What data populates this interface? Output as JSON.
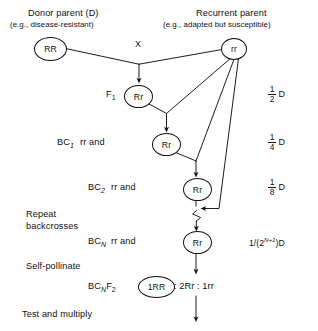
{
  "diagram": {
    "type": "pedigree-flow",
    "headings": {
      "donor_title": "Donor parent (D)",
      "donor_subtitle": "(e.g., disease-resistant)",
      "recurrent_title": "Recurrent parent",
      "recurrent_subtitle": "(e.g., adapted but susceptible)"
    },
    "cross_symbol": "X",
    "nodes": {
      "donor": "RR",
      "recurrent": "rr",
      "f1": "Rr",
      "bc1": "Rr",
      "bc2": "Rr",
      "bcn": "Rr",
      "bcnf2": "1RR"
    },
    "rows": [
      {
        "id": "f1",
        "prefix": "F",
        "sub": "1",
        "mid": "",
        "tail": ""
      },
      {
        "id": "bc1",
        "prefix": "BC",
        "sub": "1",
        "mid": "rr  and",
        "tail": ""
      },
      {
        "id": "bc2",
        "prefix": "BC",
        "sub": "2",
        "mid": "rr  and",
        "tail": ""
      },
      {
        "id": "bcn",
        "prefix": "BC",
        "sub": "N",
        "mid": "rr  and",
        "tail": ""
      },
      {
        "id": "bcnf2",
        "prefix": "BC",
        "sub": "N",
        "mid": "",
        "tail": ": 2Rr : 1rr",
        "suffix2": "F",
        "suffix2sub": "2"
      }
    ],
    "row_labels": {
      "f1_prefix": "F",
      "f1_sub": "1",
      "bc1_prefix": "BC",
      "bc1_sub": "1",
      "bc1_mid": "rr  and",
      "bc2_prefix": "BC",
      "bc2_sub": "2",
      "bc2_mid": "rr  and",
      "bcn_prefix": "BC",
      "bcn_sub": "N",
      "bcn_mid": "rr  and",
      "bcnf2_prefix": "BC",
      "bcnf2_sub": "N",
      "bcnf2_prefix2": "F",
      "bcnf2_sub2": "2",
      "bcnf2_ratio": ": 2Rr : 1rr"
    },
    "steps": {
      "repeat_line1": "Repeat",
      "repeat_line2": "backcrosses",
      "self_pollinate": "Self-pollinate",
      "test_multiply": "Test and multiply"
    },
    "donor_fractions": [
      {
        "num": "1",
        "den": "2",
        "unit": "D"
      },
      {
        "num": "1",
        "den": "4",
        "unit": "D"
      },
      {
        "num": "1",
        "den": "8",
        "unit": "D"
      }
    ],
    "general_formula": {
      "lead": "1/(2",
      "exp": "N+1",
      "close": ")D"
    },
    "colors": {
      "line": "#111111",
      "text": "#111111",
      "background": "#ffffff"
    }
  }
}
